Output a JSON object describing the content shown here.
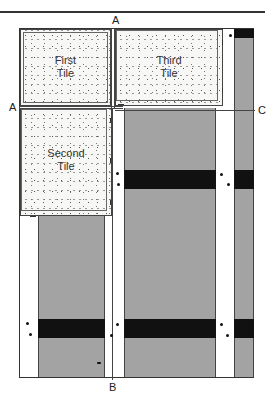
{
  "figure": {
    "tiles": [
      {
        "id": "first",
        "line1": "First",
        "line2": "Tile"
      },
      {
        "id": "second",
        "line1": "Second",
        "line2": "Tile"
      },
      {
        "id": "third",
        "line1": "Third",
        "line2": "Tile"
      }
    ],
    "reference_lines": {
      "vertical_top": "A",
      "horizontal_left": "A",
      "bottom": "B",
      "right": "C"
    },
    "colors": {
      "tile_fill": "#f7f7f5",
      "strip_gray": "#a3a3a3",
      "band_black": "#111111",
      "line": "#333333"
    }
  }
}
